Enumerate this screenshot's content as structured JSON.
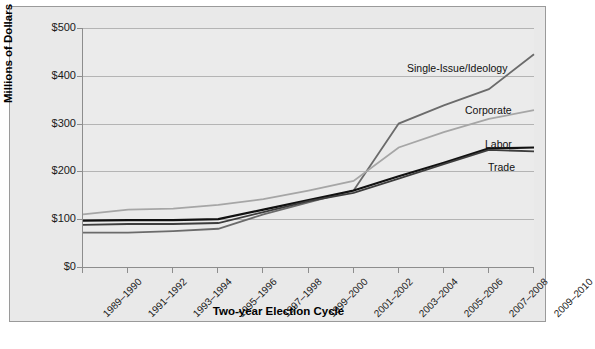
{
  "chart_data": {
    "type": "line",
    "title": "",
    "xlabel": "Two-year Election Cycle",
    "ylabel": "Millions of Dollars",
    "categories": [
      "1989–1990",
      "1991–1992",
      "1993–1994",
      "1995–1996",
      "1997–1998",
      "1999–2000",
      "2001–2002",
      "2003–2004",
      "2005–2006",
      "2007–2008",
      "2009–2010"
    ],
    "ylim": [
      0,
      500
    ],
    "yticks": [
      0,
      100,
      200,
      300,
      400,
      500
    ],
    "ytick_labels": [
      "$0",
      "$100",
      "$200",
      "$300",
      "$400",
      "$500"
    ],
    "grid": "horizontal",
    "legend_position": "inline-end-labels",
    "series": [
      {
        "name": "Single-Issue/Ideology",
        "color": "#6b6b6b",
        "width": 1.8,
        "values": [
          72,
          72,
          75,
          80,
          110,
          135,
          160,
          300,
          338,
          372,
          445
        ],
        "label_x": 397,
        "label_y": 55
      },
      {
        "name": "Corporate",
        "color": "#a6a6a6",
        "width": 1.8,
        "values": [
          110,
          120,
          122,
          130,
          142,
          160,
          180,
          250,
          282,
          310,
          328
        ],
        "label_x": 455,
        "label_y": 97
      },
      {
        "name": "Labor",
        "color": "#111111",
        "width": 2.2,
        "values": [
          97,
          98,
          98,
          100,
          120,
          140,
          160,
          190,
          218,
          248,
          250
        ],
        "label_x": 475,
        "label_y": 131
      },
      {
        "name": "Trade",
        "color": "#3d3d3d",
        "width": 1.8,
        "values": [
          88,
          90,
          90,
          92,
          115,
          138,
          155,
          185,
          215,
          245,
          242
        ],
        "label_x": 478,
        "label_y": 154
      }
    ]
  },
  "axes": {
    "ytick_labels": [
      "$500",
      "$400",
      "$300",
      "$200",
      "$100",
      "$0"
    ],
    "ylabel": "Millions of Dollars",
    "xlabel": "Two-year Election Cycle"
  }
}
